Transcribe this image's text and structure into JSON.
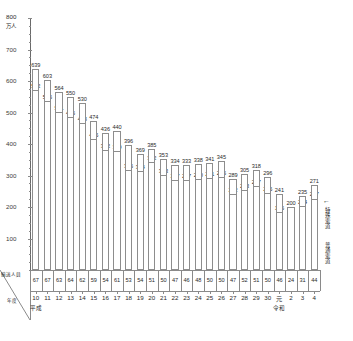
{
  "chart_data": {
    "type": "bar",
    "title": "",
    "xlabel": "年度",
    "ylabel": "万人",
    "ylim": [
      0,
      800
    ],
    "yticks": [
      100,
      200,
      300,
      400,
      500,
      600,
      700,
      800
    ],
    "grid": false,
    "legend_position": "right",
    "categories": [
      "10",
      "11",
      "12",
      "13",
      "14",
      "15",
      "16",
      "17",
      "18",
      "19",
      "20",
      "21",
      "22",
      "23",
      "24",
      "25",
      "26",
      "27",
      "28",
      "29",
      "30",
      "元",
      "2",
      "3",
      "4"
    ],
    "era_labels": [
      {
        "text": "平成",
        "at": "10"
      },
      {
        "text": "令和",
        "at": "元"
      }
    ],
    "series": [
      {
        "name": "特殊索道",
        "values": [
          639,
          603,
          564,
          550,
          530,
          474,
          436,
          440,
          396,
          369,
          385,
          353,
          334,
          333,
          338,
          341,
          345,
          289,
          305,
          318,
          296,
          241,
          200,
          235,
          271
        ]
      },
      {
        "name": "普通索道",
        "values": [
          572,
          536,
          501,
          486,
          468,
          415,
          382,
          379,
          316,
          314,
          342,
          303,
          287,
          287,
          290,
          291,
          295,
          242,
          253,
          267,
          246,
          185,
          null,
          204,
          227
        ]
      },
      {
        "name": "輸送人員",
        "values": [
          67,
          67,
          63,
          64,
          62,
          59,
          54,
          61,
          53,
          54,
          51,
          50,
          47,
          46,
          48,
          50,
          50,
          47,
          52,
          51,
          50,
          46,
          24,
          31,
          44
        ]
      }
    ]
  },
  "axis": {
    "y_unit": "万人",
    "y_max_label": "800",
    "corner_top": "輸送人員",
    "corner_bottom": "年度"
  },
  "legend": {
    "items": [
      {
        "label": "特殊索道"
      },
      {
        "label": "普通索道"
      }
    ],
    "arrow_glyph": "←"
  }
}
